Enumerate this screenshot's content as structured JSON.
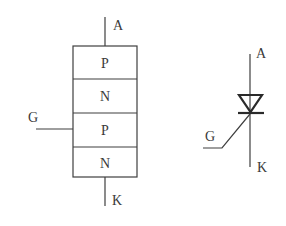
{
  "diagram": {
    "structure": {
      "layers": [
        {
          "label": "P"
        },
        {
          "label": "N"
        },
        {
          "label": "P"
        },
        {
          "label": "N"
        }
      ],
      "terminals": {
        "anode": "A",
        "gate": "G",
        "cathode": "K"
      }
    },
    "symbol": {
      "terminals": {
        "anode": "A",
        "gate": "G",
        "cathode": "K"
      }
    },
    "colors": {
      "line": "#3f3f3f",
      "text": "#3a3a3a",
      "background": "#ffffff"
    }
  }
}
